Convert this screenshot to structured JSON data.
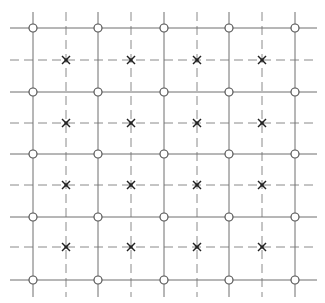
{
  "diagram": {
    "title": "",
    "width": 325,
    "height": 303,
    "colors": {
      "background": "#ffffff",
      "solid_line": "#6e6e6e",
      "dashed_line": "#8a8a8a",
      "circle_marker": "#555555",
      "cross_marker": "#222222"
    },
    "extent": {
      "x_min": 10,
      "x_max": 317,
      "y_min": 12,
      "y_max": 297
    },
    "solid_vertical_x": [
      33,
      98,
      164,
      229,
      295
    ],
    "dashed_vertical_x": [
      66,
      131,
      197,
      262
    ],
    "solid_horizontal_y": [
      28,
      92,
      154,
      217,
      280
    ],
    "dashed_horizontal_y": [
      60,
      123,
      185,
      247
    ],
    "markers": {
      "circle": {
        "name": "circle-marker",
        "placement": "solid-solid intersections",
        "radius": 4
      },
      "cross": {
        "name": "cross-marker",
        "placement": "dashed-dashed intersections",
        "size": 4
      }
    }
  }
}
